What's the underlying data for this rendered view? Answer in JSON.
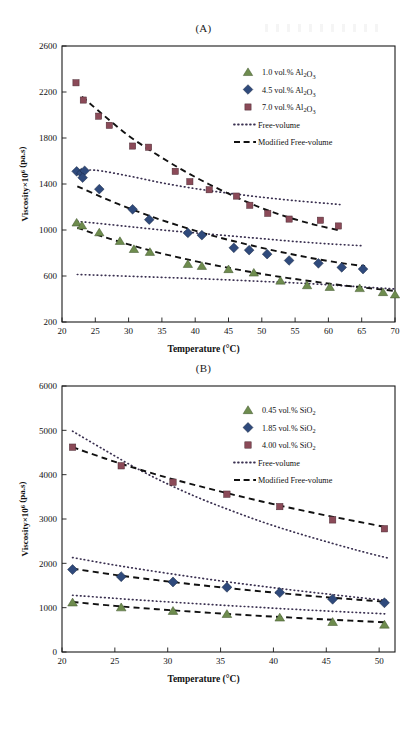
{
  "figure": {
    "panel_a_label": "(A)",
    "panel_b_label": "(B)"
  },
  "chart_data": [
    {
      "id": "panel_a",
      "type": "scatter",
      "title": "(A)",
      "xlabel": "Temperature (°C)",
      "ylabel": "Viscosity×10⁶ (pa.s)",
      "xlim": [
        20,
        70
      ],
      "ylim": [
        200,
        2600
      ],
      "xticks": [
        20,
        25,
        30,
        35,
        40,
        45,
        50,
        55,
        60,
        65,
        70
      ],
      "yticks": [
        200,
        600,
        1000,
        1400,
        1800,
        2200,
        2600
      ],
      "grid": false,
      "legend_position": "top-right",
      "legend": [
        {
          "label": "1.0 vol.% Al₂O₃",
          "marker": "triangle",
          "color": "#6E8C4E"
        },
        {
          "label": "4.5 vol.% Al₂O₃",
          "marker": "diamond",
          "color": "#2F4A7C"
        },
        {
          "label": "7.0 vol.% Al₂O₃",
          "marker": "square",
          "color": "#8B4A58"
        },
        {
          "label": "Free-volume",
          "marker": "dotted-line",
          "color": "#3A3050"
        },
        {
          "label": "Modified Free-volume",
          "marker": "dashed-line",
          "color": "#111111"
        }
      ],
      "series": [
        {
          "name": "1.0 vol.% Al₂O₃",
          "marker": "triangle",
          "color": "#6E8C4E",
          "points": [
            [
              22.2,
              1065
            ],
            [
              23.0,
              1040
            ],
            [
              25.6,
              980
            ],
            [
              28.7,
              905
            ],
            [
              30.8,
              835
            ],
            [
              33.2,
              810
            ],
            [
              38.9,
              705
            ],
            [
              41.0,
              688
            ],
            [
              45.0,
              660
            ],
            [
              48.8,
              630
            ],
            [
              52.8,
              560
            ],
            [
              56.8,
              520
            ],
            [
              60.2,
              505
            ],
            [
              64.7,
              495
            ],
            [
              68.2,
              460
            ],
            [
              70.0,
              440
            ]
          ]
        },
        {
          "name": "4.5 vol.% Al₂O₃",
          "marker": "diamond",
          "color": "#2F4A7C",
          "points": [
            [
              22.2,
              1510
            ],
            [
              22.9,
              1495
            ],
            [
              23.4,
              1515
            ],
            [
              23.1,
              1455
            ],
            [
              25.6,
              1355
            ],
            [
              30.6,
              1180
            ],
            [
              33.1,
              1090
            ],
            [
              38.9,
              975
            ],
            [
              41.0,
              955
            ],
            [
              45.8,
              845
            ],
            [
              48.1,
              825
            ],
            [
              50.8,
              790
            ],
            [
              54.1,
              735
            ],
            [
              58.5,
              710
            ],
            [
              62.0,
              675
            ],
            [
              65.2,
              660
            ]
          ]
        },
        {
          "name": "7.0 vol.% Al₂O₃",
          "marker": "square",
          "color": "#8B4A58",
          "points": [
            [
              22.1,
              2280
            ],
            [
              23.2,
              2130
            ],
            [
              25.5,
              1990
            ],
            [
              27.1,
              1910
            ],
            [
              30.6,
              1730
            ],
            [
              33.0,
              1720
            ],
            [
              37.0,
              1510
            ],
            [
              39.2,
              1420
            ],
            [
              42.1,
              1350
            ],
            [
              46.2,
              1295
            ],
            [
              48.2,
              1215
            ],
            [
              50.9,
              1145
            ],
            [
              54.1,
              1095
            ],
            [
              58.8,
              1085
            ],
            [
              61.5,
              1035
            ]
          ]
        }
      ],
      "model_curves": [
        {
          "name": "Free-volume 7.0",
          "style": "dotted",
          "color": "#3A3050",
          "points": [
            [
              22.4,
              1510
            ],
            [
              25,
              1520
            ],
            [
              30,
              1470
            ],
            [
              35,
              1410
            ],
            [
              40,
              1360
            ],
            [
              45,
              1320
            ],
            [
              50,
              1285
            ],
            [
              55,
              1255
            ],
            [
              60,
              1230
            ],
            [
              62,
              1220
            ]
          ]
        },
        {
          "name": "Free-volume 4.5",
          "style": "dotted",
          "color": "#3A3050",
          "points": [
            [
              22.3,
              1075
            ],
            [
              25,
              1060
            ],
            [
              30,
              1030
            ],
            [
              35,
              1000
            ],
            [
              40,
              975
            ],
            [
              45,
              950
            ],
            [
              50,
              925
            ],
            [
              55,
              900
            ],
            [
              60,
              880
            ],
            [
              65.3,
              862
            ]
          ]
        },
        {
          "name": "Free-volume 1.0",
          "style": "dotted",
          "color": "#3A3050",
          "points": [
            [
              22.3,
              613
            ],
            [
              25,
              608
            ],
            [
              30,
              598
            ],
            [
              35,
              588
            ],
            [
              40,
              578
            ],
            [
              45,
              566
            ],
            [
              50,
              553
            ],
            [
              55,
              540
            ],
            [
              60,
              524
            ],
            [
              65,
              505
            ],
            [
              70,
              487
            ]
          ]
        },
        {
          "name": "Modified Free-volume 7.0",
          "style": "dashed",
          "color": "#111111",
          "points": [
            [
              23.0,
              2160
            ],
            [
              26,
              2010
            ],
            [
              30,
              1820
            ],
            [
              34,
              1665
            ],
            [
              38,
              1525
            ],
            [
              42,
              1400
            ],
            [
              46,
              1290
            ],
            [
              50,
              1190
            ],
            [
              54,
              1110
            ],
            [
              58,
              1045
            ],
            [
              61.8,
              995
            ]
          ]
        },
        {
          "name": "Modified Free-volume 4.5",
          "style": "dashed",
          "color": "#111111",
          "points": [
            [
              22.3,
              1380
            ],
            [
              26,
              1285
            ],
            [
              30,
              1190
            ],
            [
              34,
              1105
            ],
            [
              38,
              1030
            ],
            [
              42,
              960
            ],
            [
              46,
              900
            ],
            [
              50,
              845
            ],
            [
              54,
              795
            ],
            [
              58,
              750
            ],
            [
              62,
              712
            ],
            [
              65.5,
              685
            ]
          ]
        },
        {
          "name": "Modified Free-volume 1.0",
          "style": "dashed",
          "color": "#111111",
          "points": [
            [
              22.3,
              1020
            ],
            [
              26,
              945
            ],
            [
              30,
              875
            ],
            [
              34,
              810
            ],
            [
              38,
              755
            ],
            [
              42,
              705
            ],
            [
              46,
              660
            ],
            [
              50,
              618
            ],
            [
              54,
              582
            ],
            [
              58,
              550
            ],
            [
              62,
              520
            ],
            [
              66,
              495
            ],
            [
              70,
              470
            ]
          ]
        }
      ]
    },
    {
      "id": "panel_b",
      "type": "scatter",
      "title": "(B)",
      "xlabel": "Temperature (°C)",
      "ylabel": "Viscosity×10⁶ (pa.s)",
      "xlim": [
        20,
        51.5
      ],
      "ylim": [
        0,
        6000
      ],
      "xticks": [
        20,
        25,
        30,
        35,
        40,
        45,
        50
      ],
      "yticks": [
        0,
        1000,
        2000,
        3000,
        4000,
        5000,
        6000
      ],
      "grid": false,
      "legend_position": "top-right",
      "legend": [
        {
          "label": "0.45 vol.% SiO₂",
          "marker": "triangle",
          "color": "#6E8C4E"
        },
        {
          "label": "1.85 vol.% SiO₂",
          "marker": "diamond",
          "color": "#2F4A7C"
        },
        {
          "label": "4.00 vol.% SiO₂",
          "marker": "square",
          "color": "#8B4A58"
        },
        {
          "label": "Free-volume",
          "marker": "dotted-line",
          "color": "#3A3050"
        },
        {
          "label": "Modified Free-volume",
          "marker": "dashed-line",
          "color": "#111111"
        }
      ],
      "series": [
        {
          "name": "0.45 vol.% SiO₂",
          "marker": "triangle",
          "color": "#6E8C4E",
          "points": [
            [
              21.0,
              1120
            ],
            [
              25.6,
              1010
            ],
            [
              30.5,
              930
            ],
            [
              35.6,
              860
            ],
            [
              40.6,
              780
            ],
            [
              45.6,
              680
            ],
            [
              50.5,
              620
            ]
          ]
        },
        {
          "name": "1.85 vol.% SiO₂",
          "marker": "diamond",
          "color": "#2F4A7C",
          "points": [
            [
              21.0,
              1860
            ],
            [
              25.6,
              1700
            ],
            [
              30.5,
              1580
            ],
            [
              35.6,
              1460
            ],
            [
              40.6,
              1340
            ],
            [
              45.6,
              1190
            ],
            [
              50.5,
              1110
            ]
          ]
        },
        {
          "name": "4.00 vol.% SiO₂",
          "marker": "square",
          "color": "#8B4A58",
          "points": [
            [
              21.0,
              4620
            ],
            [
              25.6,
              4200
            ],
            [
              30.5,
              3830
            ],
            [
              35.6,
              3560
            ],
            [
              40.6,
              3280
            ],
            [
              45.6,
              2980
            ],
            [
              50.5,
              2780
            ]
          ]
        }
      ],
      "model_curves": [
        {
          "name": "Free-volume 4.00",
          "style": "dotted",
          "color": "#3A3050",
          "points": [
            [
              21.0,
              4980
            ],
            [
              24,
              4560
            ],
            [
              27,
              4150
            ],
            [
              30,
              3790
            ],
            [
              33,
              3470
            ],
            [
              36,
              3190
            ],
            [
              39,
              2930
            ],
            [
              42,
              2700
            ],
            [
              45,
              2490
            ],
            [
              48,
              2290
            ],
            [
              50.8,
              2120
            ]
          ]
        },
        {
          "name": "Free-volume 1.85",
          "style": "dotted",
          "color": "#3A3050",
          "points": [
            [
              21.0,
              2130
            ],
            [
              25,
              1960
            ],
            [
              29,
              1810
            ],
            [
              33,
              1670
            ],
            [
              37,
              1540
            ],
            [
              41,
              1420
            ],
            [
              45,
              1310
            ],
            [
              48,
              1230
            ],
            [
              50.8,
              1160
            ]
          ]
        },
        {
          "name": "Free-volume 0.45",
          "style": "dotted",
          "color": "#3A3050",
          "points": [
            [
              21.0,
              1280
            ],
            [
              25,
              1210
            ],
            [
              29,
              1145
            ],
            [
              33,
              1085
            ],
            [
              37,
              1030
            ],
            [
              41,
              975
            ],
            [
              45,
              925
            ],
            [
              48,
              890
            ],
            [
              50.8,
              858
            ]
          ]
        },
        {
          "name": "Modified Free-volume 4.00",
          "style": "dashed",
          "color": "#111111",
          "points": [
            [
              21.0,
              4620
            ],
            [
              24,
              4370
            ],
            [
              27,
              4140
            ],
            [
              30,
              3930
            ],
            [
              33,
              3740
            ],
            [
              36,
              3560
            ],
            [
              39,
              3390
            ],
            [
              42,
              3230
            ],
            [
              45,
              3080
            ],
            [
              48,
              2940
            ],
            [
              50.8,
              2810
            ]
          ]
        },
        {
          "name": "Modified Free-volume 1.85",
          "style": "dashed",
          "color": "#111111",
          "points": [
            [
              21.0,
              1880
            ],
            [
              25,
              1740
            ],
            [
              29,
              1620
            ],
            [
              33,
              1510
            ],
            [
              37,
              1410
            ],
            [
              41,
              1320
            ],
            [
              45,
              1235
            ],
            [
              48,
              1180
            ],
            [
              50.8,
              1130
            ]
          ]
        },
        {
          "name": "Modified Free-volume 0.45",
          "style": "dashed",
          "color": "#111111",
          "points": [
            [
              21.0,
              1130
            ],
            [
              25,
              1040
            ],
            [
              29,
              965
            ],
            [
              33,
              900
            ],
            [
              37,
              840
            ],
            [
              41,
              785
            ],
            [
              45,
              735
            ],
            [
              48,
              700
            ],
            [
              50.8,
              668
            ]
          ]
        }
      ]
    }
  ]
}
